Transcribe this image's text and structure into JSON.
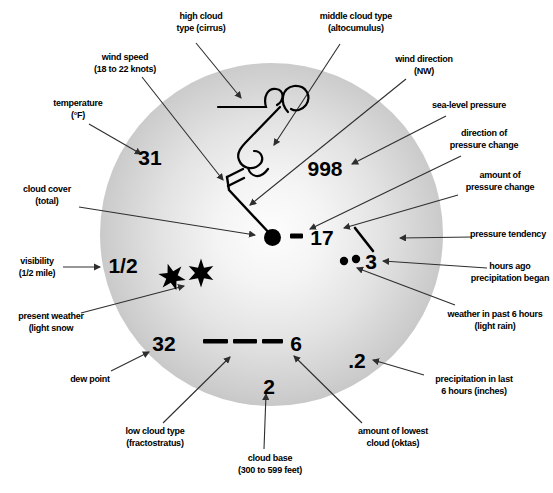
{
  "figure": {
    "colors": {
      "background": "#ffffff",
      "circle_rim": "#a6a6a6",
      "circle_center": "#fdfdfd",
      "ink": "#000000",
      "arrow": "#2e2e2e"
    }
  },
  "station_model": {
    "values": {
      "temperature": "31",
      "sea_level_pressure": "998",
      "pressure_change_amount": "17",
      "hours_ago_precipitation_began": "3",
      "visibility": "1/2",
      "dew_point": "32",
      "amount_of_lowest_cloud": "6",
      "cloud_base_code": "2",
      "precipitation_last_6_hours": ".2"
    },
    "symbols": {
      "cloud_cover": "overcast filled circle",
      "wind_barb": "shaft from NW with two full barbs (20 knots)",
      "high_cloud": "cirrus hooks",
      "middle_cloud": "altocumulus curl",
      "present_weather": "two six-pointed snow stars",
      "past_weather": "two rain dots",
      "pressure_change_direction": "minus bar (pressure fell)",
      "pressure_tendency": "falling slash",
      "low_cloud": "three dashes (fractostratus)"
    }
  },
  "labels": {
    "high_cloud": {
      "line1": "high cloud",
      "line2": "type (cirrus)"
    },
    "middle_cloud": {
      "line1": "middle cloud type",
      "line2": "(altocumulus)"
    },
    "wind_speed": {
      "line1": "wind speed",
      "line2": "(18 to 22 knots)"
    },
    "wind_direction": {
      "line1": "wind direction",
      "line2": "(NW)"
    },
    "temperature": {
      "line1": "temperature",
      "line2": "(°F)"
    },
    "sea_level_pressure": {
      "line1": "sea-level pressure"
    },
    "cloud_cover": {
      "line1": "cloud cover",
      "line2": "(total)"
    },
    "direction_pressure_change": {
      "line1": "direction of",
      "line2": "pressure change"
    },
    "amount_pressure_change": {
      "line1": "amount of",
      "line2": "pressure change"
    },
    "pressure_tendency": {
      "line1": "pressure tendency"
    },
    "visibility": {
      "line1": "visibility",
      "line2": "(1/2 mile)"
    },
    "hours_ago": {
      "line1": "hours ago",
      "line2": "precipitation began"
    },
    "present_weather": {
      "line1": "present weather",
      "line2": "(light snow"
    },
    "weather_past_6h": {
      "line1": "weather in past 6 hours",
      "line2": "(light rain)"
    },
    "dew_point": {
      "line1": "dew point"
    },
    "low_cloud": {
      "line1": "low cloud type",
      "line2": "(fractostratus)"
    },
    "cloud_base": {
      "line1": "cloud base",
      "line2": "(300 to 599 feet)"
    },
    "amount_lowest_cloud": {
      "line1": "amount of lowest",
      "line2": "cloud (oktas)"
    },
    "precip_last_6h": {
      "line1": "precipitation in last",
      "line2": "6 hours (inches)"
    }
  }
}
